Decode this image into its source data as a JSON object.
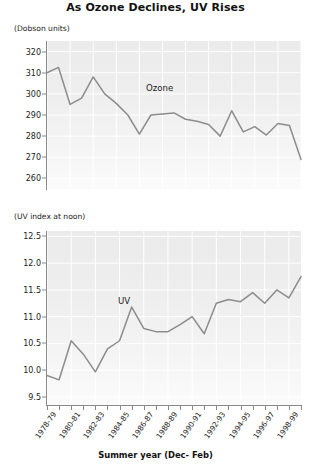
{
  "title": "As Ozone Declines, UV Rises",
  "xaxis_title": "Summer year (Dec- Feb)",
  "panels": {
    "ozone": {
      "unit_label": "(Dobson units)",
      "annotation": "Ozone",
      "ytick_labels": [
        "320",
        "310",
        "300",
        "290",
        "280",
        "270",
        "260"
      ]
    },
    "uv": {
      "unit_label": "(UV index at noon)",
      "annotation": "UV",
      "ytick_labels": [
        "12.5",
        "12.0",
        "11.5",
        "11.0",
        "10.5",
        "10.0",
        "9.5"
      ]
    }
  },
  "xtick_labels": [
    "1978-79",
    "1980-81",
    "1982-83",
    "1984-85",
    "1986-87",
    "1988-89",
    "1990-91",
    "1992-93",
    "1994-95",
    "1996-97",
    "1998-99"
  ],
  "colors": {
    "line": "#8c8c8c",
    "axis": "#8a8a8a",
    "grid": "#ffffff",
    "plot_background_top": "#ebebeb",
    "plot_background_bottom": "#fbfbfb",
    "text": "#1c1c1c"
  },
  "chart_data": [
    {
      "type": "line",
      "title": "As Ozone Declines, UV Rises",
      "subtitle": "Ozone panel",
      "xlabel": "Summer year (Dec- Feb)",
      "ylabel": "(Dobson units)",
      "ylim": [
        255,
        325
      ],
      "yticks": [
        260,
        270,
        280,
        290,
        300,
        310,
        320
      ],
      "grid": true,
      "legend": "none",
      "annotations": [
        "Ozone"
      ],
      "x": [
        "1978-79",
        "1979-80",
        "1980-81",
        "1981-82",
        "1982-83",
        "1983-84",
        "1984-85",
        "1985-86",
        "1986-87",
        "1987-88",
        "1988-89",
        "1989-90",
        "1990-91",
        "1991-92",
        "1992-93",
        "1993-94",
        "1994-95",
        "1995-96",
        "1996-97",
        "1997-98",
        "1998-99"
      ],
      "series": [
        {
          "name": "Ozone",
          "values": [
            310,
            312.5,
            295,
            298,
            308,
            300,
            295.5,
            290,
            281,
            290,
            290.5,
            291,
            288,
            287,
            285.5,
            280,
            292,
            282,
            284.5,
            280.5,
            286,
            285,
            269
          ]
        }
      ]
    },
    {
      "type": "line",
      "subtitle": "UV panel",
      "xlabel": "Summer year (Dec- Feb)",
      "ylabel": "(UV index at noon)",
      "ylim": [
        9.35,
        12.6
      ],
      "yticks": [
        9.5,
        10.0,
        10.5,
        11.0,
        11.5,
        12.0,
        12.5
      ],
      "grid": true,
      "legend": "none",
      "annotations": [
        "UV"
      ],
      "x": [
        "1978-79",
        "1979-80",
        "1980-81",
        "1981-82",
        "1982-83",
        "1983-84",
        "1984-85",
        "1985-86",
        "1986-87",
        "1987-88",
        "1988-89",
        "1989-90",
        "1990-91",
        "1991-92",
        "1992-93",
        "1993-94",
        "1994-95",
        "1995-96",
        "1996-97",
        "1997-98",
        "1998-99"
      ],
      "series": [
        {
          "name": "UV index at noon",
          "values": [
            9.9,
            9.82,
            10.55,
            10.3,
            9.97,
            10.4,
            10.55,
            11.18,
            10.78,
            10.72,
            10.72,
            10.85,
            11.0,
            10.68,
            11.25,
            11.32,
            11.28,
            11.45,
            11.25,
            11.5,
            11.35,
            11.75
          ]
        }
      ]
    }
  ]
}
